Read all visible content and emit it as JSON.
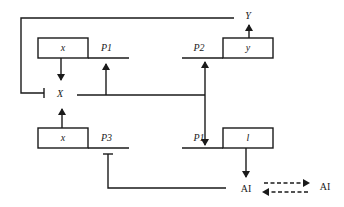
{
  "diagram": {
    "type": "genetic-regulatory-circuit",
    "colors": {
      "line": "#1a1a1a",
      "background": "#ffffff"
    },
    "genes": [
      {
        "id": "gene-x-top",
        "label": "x",
        "promoter": "P1"
      },
      {
        "id": "gene-y",
        "label": "y",
        "promoter": "P2"
      },
      {
        "id": "gene-x-bottom",
        "label": "x",
        "promoter": "P3"
      },
      {
        "id": "gene-l",
        "label": "l",
        "promoter": "P1"
      }
    ],
    "nodes": {
      "X": "X",
      "Y": "Y",
      "AI_left": "AI",
      "AI_right": "AI"
    },
    "edges": [
      {
        "from": "gene-x-top",
        "to": "X",
        "kind": "activation"
      },
      {
        "from": "X",
        "to": "P1 (top)",
        "kind": "activation"
      },
      {
        "from": "X",
        "to": "P2",
        "kind": "activation"
      },
      {
        "from": "X",
        "to": "P1 (bottom)",
        "kind": "activation"
      },
      {
        "from": "gene-y",
        "to": "Y",
        "kind": "activation"
      },
      {
        "from": "Y",
        "to": "X",
        "kind": "inhibition"
      },
      {
        "from": "gene-x-bottom",
        "to": "X",
        "kind": "activation"
      },
      {
        "from": "gene-l",
        "to": "AI",
        "kind": "activation"
      },
      {
        "from": "AI",
        "to": "P3",
        "kind": "inhibition"
      },
      {
        "from": "AI",
        "to": "AI (extracellular)",
        "kind": "diffusion-bidirectional"
      }
    ]
  }
}
